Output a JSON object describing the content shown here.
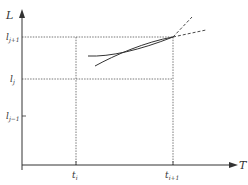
{
  "diagram": {
    "y_axis": {
      "label": "L"
    },
    "x_axis": {
      "label": "T"
    },
    "y_ticks": [
      {
        "main": "l",
        "sub": "j+1"
      },
      {
        "main": "l",
        "sub": "j"
      },
      {
        "main": "l",
        "sub": "j−1"
      }
    ],
    "x_ticks": [
      {
        "main": "t",
        "sub": "i"
      },
      {
        "main": "t",
        "sub": "i+1"
      }
    ],
    "colors": {
      "line": "#333333",
      "grid": "#555555"
    }
  }
}
